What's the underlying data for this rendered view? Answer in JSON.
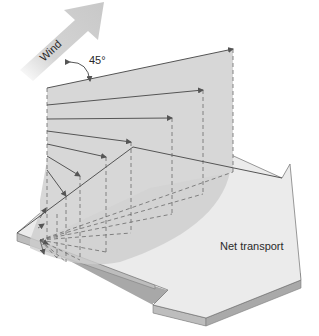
{
  "diagram": {
    "wind_label": "Wind",
    "angle_label": "45°",
    "net_transport_label": "Net transport"
  },
  "colors": {
    "plane_fill": "#d7d7d7",
    "arrow_top": "#ebebeb",
    "arrow_edge": "#9c9c9c",
    "wind_arrow": "#cfcfcf",
    "line": "#555555",
    "dashed": "#6a6a6a",
    "text": "#2a2a2a"
  }
}
